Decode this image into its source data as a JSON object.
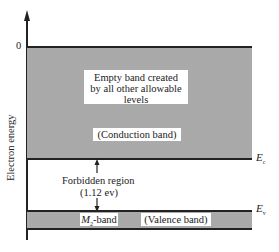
{
  "diagram": {
    "type": "energy-band-diagram",
    "axis": {
      "label": "Electron energy",
      "zero_tick": "0"
    },
    "conduction_band": {
      "description_line1": "Empty band created",
      "description_line2": "by all other allowable",
      "description_line3": "levels",
      "name": "(Conduction band)",
      "edge_label": "E",
      "edge_subscript": "c"
    },
    "forbidden_region": {
      "label": "Forbidden region",
      "gap": "(1.12 ev)"
    },
    "valence_band": {
      "band_label": "M",
      "band_label_subscript": "2",
      "band_label_suffix": "-band",
      "name": "(Valence band)",
      "edge_label": "E",
      "edge_subscript": "v"
    },
    "colors": {
      "line": "#222222",
      "band_fill": "#e4e4e4",
      "stipple": "#8a8a8a",
      "background": "#ffffff"
    }
  }
}
